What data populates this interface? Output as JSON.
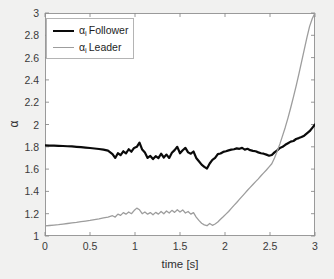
{
  "chart_data": {
    "type": "line",
    "title": "",
    "xlabel": "time [s]",
    "ylabel": "α",
    "xlim": [
      0,
      3
    ],
    "ylim": [
      1,
      3
    ],
    "xticks": [
      "0",
      "0.5",
      "1",
      "1.5",
      "2",
      "2.5",
      "3"
    ],
    "yticks": [
      "1",
      "1.2",
      "1.4",
      "1.6",
      "1.8",
      "2",
      "2.2",
      "2.4",
      "2.6",
      "2.8",
      "3"
    ],
    "grid": false,
    "legend_position": "upper-left",
    "series": [
      {
        "name": "α_i Follower",
        "label_base": "α",
        "label_sub": "i",
        "label_rest": "Follower",
        "color": "#0a0a0a",
        "width": 2.2,
        "x": [
          0,
          0.05,
          0.1,
          0.15,
          0.2,
          0.25,
          0.3,
          0.35,
          0.4,
          0.45,
          0.5,
          0.55,
          0.6,
          0.65,
          0.7,
          0.75,
          0.78,
          0.81,
          0.84,
          0.87,
          0.9,
          0.93,
          0.96,
          0.99,
          1.02,
          1.05,
          1.08,
          1.11,
          1.14,
          1.17,
          1.2,
          1.23,
          1.26,
          1.29,
          1.32,
          1.35,
          1.38,
          1.41,
          1.44,
          1.47,
          1.5,
          1.53,
          1.56,
          1.59,
          1.62,
          1.65,
          1.68,
          1.71,
          1.74,
          1.77,
          1.8,
          1.83,
          1.86,
          1.89,
          1.92,
          1.95,
          1.98,
          2.01,
          2.04,
          2.07,
          2.1,
          2.13,
          2.16,
          2.19,
          2.22,
          2.25,
          2.28,
          2.31,
          2.34,
          2.37,
          2.4,
          2.43,
          2.46,
          2.49,
          2.52,
          2.55,
          2.58,
          2.61,
          2.64,
          2.67,
          2.7,
          2.73,
          2.76,
          2.79,
          2.82,
          2.85,
          2.88,
          2.91,
          2.94,
          2.97,
          3.0
        ],
        "y": [
          1.812,
          1.811,
          1.81,
          1.809,
          1.807,
          1.805,
          1.803,
          1.8,
          1.797,
          1.793,
          1.789,
          1.785,
          1.78,
          1.774,
          1.766,
          1.735,
          1.7,
          1.742,
          1.725,
          1.76,
          1.742,
          1.778,
          1.756,
          1.79,
          1.8,
          1.838,
          1.775,
          1.748,
          1.7,
          1.718,
          1.69,
          1.716,
          1.698,
          1.738,
          1.704,
          1.73,
          1.7,
          1.746,
          1.77,
          1.8,
          1.742,
          1.769,
          1.79,
          1.75,
          1.738,
          1.758,
          1.7,
          1.67,
          1.64,
          1.62,
          1.605,
          1.65,
          1.682,
          1.7,
          1.735,
          1.74,
          1.754,
          1.76,
          1.768,
          1.775,
          1.778,
          1.786,
          1.782,
          1.79,
          1.775,
          1.782,
          1.77,
          1.764,
          1.76,
          1.75,
          1.742,
          1.738,
          1.73,
          1.72,
          1.726,
          1.75,
          1.768,
          1.79,
          1.8,
          1.818,
          1.832,
          1.846,
          1.852,
          1.87,
          1.878,
          1.888,
          1.9,
          1.92,
          1.94,
          1.97,
          2.0
        ]
      },
      {
        "name": "α_i Leader",
        "label_base": "α",
        "label_sub": "i",
        "label_rest": "Leader",
        "color": "#9d9d9d",
        "width": 1.3,
        "x": [
          0,
          0.05,
          0.1,
          0.15,
          0.2,
          0.25,
          0.3,
          0.35,
          0.4,
          0.45,
          0.5,
          0.55,
          0.6,
          0.65,
          0.7,
          0.75,
          0.78,
          0.81,
          0.84,
          0.87,
          0.9,
          0.93,
          0.96,
          0.99,
          1.02,
          1.05,
          1.08,
          1.11,
          1.14,
          1.17,
          1.2,
          1.23,
          1.26,
          1.29,
          1.32,
          1.35,
          1.38,
          1.41,
          1.44,
          1.47,
          1.5,
          1.53,
          1.56,
          1.59,
          1.62,
          1.65,
          1.68,
          1.71,
          1.74,
          1.77,
          1.8,
          1.83,
          1.86,
          1.89,
          1.92,
          1.95,
          1.98,
          2.01,
          2.04,
          2.07,
          2.1,
          2.13,
          2.16,
          2.19,
          2.22,
          2.25,
          2.28,
          2.31,
          2.34,
          2.37,
          2.4,
          2.43,
          2.46,
          2.49,
          2.52,
          2.55,
          2.58,
          2.61,
          2.64,
          2.67,
          2.7,
          2.73,
          2.76,
          2.79,
          2.82,
          2.85,
          2.88,
          2.91,
          2.94,
          2.97,
          3.0
        ],
        "y": [
          1.09,
          1.094,
          1.098,
          1.102,
          1.107,
          1.112,
          1.117,
          1.122,
          1.128,
          1.134,
          1.14,
          1.147,
          1.154,
          1.162,
          1.17,
          1.182,
          1.17,
          1.196,
          1.185,
          1.21,
          1.196,
          1.215,
          1.2,
          1.228,
          1.25,
          1.235,
          1.2,
          1.215,
          1.196,
          1.21,
          1.19,
          1.212,
          1.196,
          1.22,
          1.2,
          1.224,
          1.206,
          1.23,
          1.212,
          1.236,
          1.215,
          1.234,
          1.206,
          1.22,
          1.196,
          1.21,
          1.17,
          1.14,
          1.115,
          1.1,
          1.092,
          1.112,
          1.096,
          1.108,
          1.125,
          1.15,
          1.172,
          1.196,
          1.22,
          1.248,
          1.275,
          1.3,
          1.328,
          1.355,
          1.382,
          1.41,
          1.436,
          1.462,
          1.488,
          1.512,
          1.54,
          1.566,
          1.592,
          1.62,
          1.648,
          1.7,
          1.76,
          1.826,
          1.9,
          1.976,
          2.06,
          2.15,
          2.245,
          2.345,
          2.45,
          2.56,
          2.67,
          2.78,
          2.88,
          2.95,
          3.0
        ]
      }
    ]
  }
}
